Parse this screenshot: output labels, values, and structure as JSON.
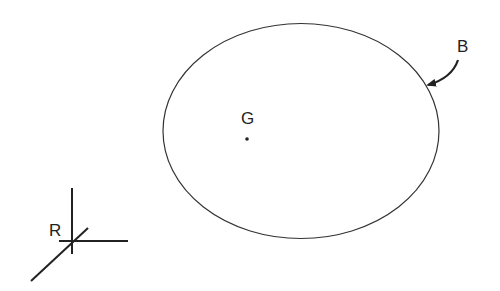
{
  "diagram": {
    "body": {
      "label": "B",
      "shape": "ellipse",
      "stroke": "#333333",
      "center": [
        301,
        131
      ],
      "rx": 138,
      "ry": 107.5
    },
    "center_of_mass": {
      "label": "G",
      "point": [
        247,
        139
      ]
    },
    "reference_frame": {
      "label": "R",
      "origin": [
        72,
        241
      ]
    }
  }
}
